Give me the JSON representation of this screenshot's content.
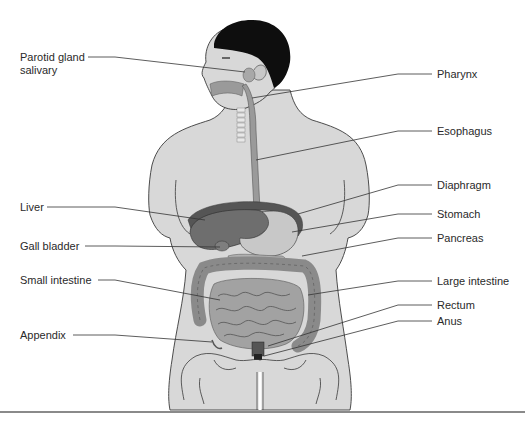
{
  "diagram": {
    "colors": {
      "skin": "#d8d8d8",
      "outline": "#3a3a3a",
      "hair": "#0e0e0e",
      "organ_dark": "#6e6e6e",
      "organ_mid": "#9a9a9a",
      "organ_light": "#c4c4c4",
      "leader": "#333333",
      "text": "#2a2a2a",
      "bottom_rule": "#8a8a8a"
    },
    "labels_left": [
      {
        "id": "parotid",
        "line1": "Parotid gland",
        "line2": "salivary"
      },
      {
        "id": "liver",
        "text": "Liver"
      },
      {
        "id": "gall-bladder",
        "text": "Gall bladder"
      },
      {
        "id": "small-intestine",
        "text": "Small intestine"
      },
      {
        "id": "appendix",
        "text": "Appendix"
      }
    ],
    "labels_right": [
      {
        "id": "pharynx",
        "text": "Pharynx"
      },
      {
        "id": "esophagus",
        "text": "Esophagus"
      },
      {
        "id": "diaphragm",
        "text": "Diaphragm"
      },
      {
        "id": "stomach",
        "text": "Stomach"
      },
      {
        "id": "pancreas",
        "text": "Pancreas"
      },
      {
        "id": "large-intestine",
        "text": "Large intestine"
      },
      {
        "id": "rectum",
        "text": "Rectum"
      },
      {
        "id": "anus",
        "text": "Anus"
      }
    ]
  }
}
